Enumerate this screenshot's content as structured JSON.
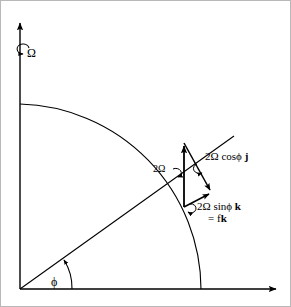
{
  "figure": {
    "background_color": "#ffffff",
    "border_color": "#b8b8b8",
    "line_color": "#000000",
    "width": 291,
    "height": 307
  },
  "axes": {
    "vertical": {
      "name": "rotation-axis",
      "label": "Ω",
      "from": [
        19,
        288
      ],
      "to": [
        19,
        20
      ],
      "arrow": "up"
    },
    "horizontal": {
      "name": "equatorial-axis",
      "label": "",
      "from": [
        19,
        288
      ],
      "to": [
        277,
        288
      ],
      "arrow": "right"
    }
  },
  "earth_arc": {
    "name": "earth-surface-arc",
    "start": [
      19,
      103
    ],
    "end": [
      200,
      288
    ],
    "description": "quarter circle from pole to equator"
  },
  "radial_line": {
    "name": "latitude-radius",
    "from": [
      19,
      288
    ],
    "to": [
      233,
      135
    ]
  },
  "angle": {
    "name": "latitude-angle",
    "symbol": "ϕ",
    "vertex": [
      19,
      288
    ],
    "arc_radius": 52
  },
  "vectors": [
    {
      "id": "omega-total",
      "label": "2Ω",
      "label_plain": "2Ω",
      "from": [
        183,
        206
      ],
      "to": [
        183,
        142
      ],
      "description": "vertical rotation vector"
    },
    {
      "id": "omega-cos",
      "label_prefix": "2Ω cosϕ ",
      "label_unit": "j",
      "label_plain": "2Ω cosϕ j",
      "from": [
        183,
        142
      ],
      "to": [
        211,
        192
      ],
      "description": "northward component"
    },
    {
      "id": "omega-sin",
      "label_prefix": "2Ω sinϕ ",
      "label_unit": "k",
      "label_plain": "2Ω sinϕ k",
      "from": [
        183,
        206
      ],
      "to": [
        211,
        192
      ],
      "description": "local vertical component"
    }
  ],
  "equation": {
    "name": "coriolis-parameter",
    "prefix": "= f",
    "unit": "k",
    "plain": "= fk"
  },
  "rotation_marks": [
    {
      "id": "axis-spin",
      "at": [
        24,
        52
      ]
    },
    {
      "id": "omega-spin",
      "at": [
        176,
        172
      ]
    },
    {
      "id": "cos-spin",
      "at": [
        199,
        168
      ]
    },
    {
      "id": "sin-spin",
      "at": [
        188,
        207
      ]
    }
  ]
}
